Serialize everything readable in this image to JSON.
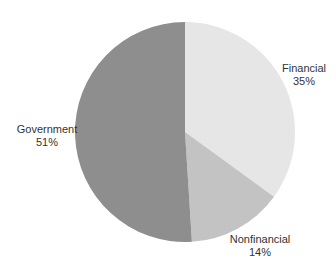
{
  "chart_data": {
    "type": "pie",
    "title": "",
    "start_angle_deg": 0,
    "direction": "clockwise",
    "slices": [
      {
        "label": "Financial",
        "value": 35,
        "pct_label": "35%",
        "color": "#e6e6e6"
      },
      {
        "label": "Nonfinancial",
        "value": 14,
        "pct_label": "14%",
        "color": "#c3c3c3"
      },
      {
        "label": "Government",
        "value": 51,
        "pct_label": "51%",
        "color": "#8e8e8e"
      }
    ],
    "legend": "none",
    "labels_outside": true
  },
  "labels": {
    "financial": {
      "name": "Financial",
      "pct": "35%"
    },
    "nonfinancial": {
      "name": "Nonfinancial",
      "pct": "14%"
    },
    "government": {
      "name": "Government",
      "pct": "51%"
    }
  }
}
